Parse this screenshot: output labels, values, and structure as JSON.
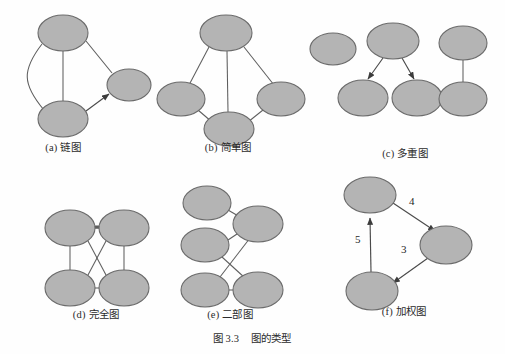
{
  "figure": {
    "number": "图 3.3",
    "title": "图的类型",
    "caption_full": "图 3.3    图的类型",
    "background_color": "#fefefe",
    "node_fill_color": "#b4b4b4",
    "node_stroke_color": "#6b6b6b",
    "edge_color": "#5e5e5e"
  },
  "panels": [
    {
      "id": "a",
      "label": "(a) 链图",
      "caption_x": 63,
      "caption_y": 143,
      "graph_type": "multigraph-with-directed-edge",
      "nodes": [
        {
          "id": "a1",
          "cx": 63,
          "cy": 33,
          "rx": 25,
          "ry": 18
        },
        {
          "id": "a2",
          "cx": 63,
          "cy": 119,
          "rx": 25,
          "ry": 18
        },
        {
          "id": "a3",
          "cx": 129,
          "cy": 85,
          "rx": 22,
          "ry": 16
        }
      ],
      "edges": [
        {
          "from": "a1",
          "to": "a2",
          "style": "straight"
        },
        {
          "from": "a1",
          "to": "a2",
          "style": "curved"
        },
        {
          "from": "a1",
          "to": "a3",
          "style": "straight"
        },
        {
          "from": "a2",
          "to": "a3",
          "style": "arrow"
        }
      ]
    },
    {
      "id": "b",
      "label": "(b) 简单图",
      "caption_x": 228,
      "caption_y": 143,
      "graph_type": "simple-graph",
      "nodes": [
        {
          "id": "b1",
          "cx": 226,
          "cy": 33,
          "rx": 26,
          "ry": 18
        },
        {
          "id": "b2",
          "cx": 181,
          "cy": 99,
          "rx": 24,
          "ry": 17
        },
        {
          "id": "b3",
          "cx": 281,
          "cy": 99,
          "rx": 24,
          "ry": 17
        },
        {
          "id": "b4",
          "cx": 229,
          "cy": 129,
          "rx": 25,
          "ry": 17
        }
      ],
      "edges": [
        {
          "from": "b1",
          "to": "b2",
          "style": "straight"
        },
        {
          "from": "b1",
          "to": "b3",
          "style": "straight"
        },
        {
          "from": "b1",
          "to": "b4",
          "style": "straight"
        },
        {
          "from": "b2",
          "to": "b4",
          "style": "straight"
        },
        {
          "from": "b3",
          "to": "b4",
          "style": "straight"
        }
      ]
    },
    {
      "id": "c",
      "label": "(c) 多重图",
      "caption_x": 405,
      "caption_y": 151,
      "graph_type": "multigraph",
      "nodes": [
        {
          "id": "c1",
          "cx": 333,
          "cy": 49,
          "rx": 23,
          "ry": 16
        },
        {
          "id": "c2",
          "cx": 393,
          "cy": 41,
          "rx": 26,
          "ry": 18
        },
        {
          "id": "c3",
          "cx": 363,
          "cy": 98,
          "rx": 25,
          "ry": 18
        },
        {
          "id": "c4",
          "cx": 417,
          "cy": 98,
          "rx": 25,
          "ry": 18
        },
        {
          "id": "c5",
          "cx": 463,
          "cy": 43,
          "rx": 24,
          "ry": 17
        },
        {
          "id": "c6",
          "cx": 463,
          "cy": 99,
          "rx": 24,
          "ry": 17
        }
      ],
      "edges": [
        {
          "from": "c2",
          "to": "c3",
          "style": "arrow"
        },
        {
          "from": "c2",
          "to": "c4",
          "style": "arrow"
        },
        {
          "from": "c5",
          "to": "c6",
          "style": "straight"
        }
      ]
    },
    {
      "id": "d",
      "label": "(d) 完全图",
      "caption_x": 96,
      "caption_y": 311,
      "graph_type": "complete-graph",
      "nodes": [
        {
          "id": "d1",
          "cx": 70,
          "cy": 228,
          "rx": 25,
          "ry": 18
        },
        {
          "id": "d2",
          "cx": 124,
          "cy": 228,
          "rx": 25,
          "ry": 18
        },
        {
          "id": "d3",
          "cx": 70,
          "cy": 288,
          "rx": 25,
          "ry": 18
        },
        {
          "id": "d4",
          "cx": 124,
          "cy": 288,
          "rx": 25,
          "ry": 18
        }
      ],
      "edges": [
        {
          "from": "d1",
          "to": "d2",
          "style": "straight"
        },
        {
          "from": "d1",
          "to": "d3",
          "style": "straight"
        },
        {
          "from": "d2",
          "to": "d4",
          "style": "straight"
        },
        {
          "from": "d3",
          "to": "d4",
          "style": "straight"
        },
        {
          "from": "d1",
          "to": "d4",
          "style": "straight"
        },
        {
          "from": "d2",
          "to": "d3",
          "style": "straight"
        }
      ]
    },
    {
      "id": "e",
      "label": "(e) 二部图",
      "caption_x": 230,
      "caption_y": 311,
      "graph_type": "bipartite-graph",
      "nodes": [
        {
          "id": "e1",
          "cx": 207,
          "cy": 203,
          "rx": 24,
          "ry": 17
        },
        {
          "id": "e2",
          "cx": 205,
          "cy": 245,
          "rx": 24,
          "ry": 17
        },
        {
          "id": "e3",
          "cx": 205,
          "cy": 290,
          "rx": 24,
          "ry": 17
        },
        {
          "id": "e4",
          "cx": 258,
          "cy": 224,
          "rx": 25,
          "ry": 18
        },
        {
          "id": "e5",
          "cx": 258,
          "cy": 290,
          "rx": 25,
          "ry": 18
        }
      ],
      "edges": [
        {
          "from": "e1",
          "to": "e4",
          "style": "straight"
        },
        {
          "from": "e2",
          "to": "e4",
          "style": "straight"
        },
        {
          "from": "e2",
          "to": "e5",
          "style": "straight"
        },
        {
          "from": "e3",
          "to": "e4",
          "style": "straight"
        },
        {
          "from": "e3",
          "to": "e5",
          "style": "straight"
        }
      ]
    },
    {
      "id": "f",
      "label": "(f) 加权图",
      "caption_x": 404,
      "caption_y": 307,
      "graph_type": "weighted-directed-graph",
      "nodes": [
        {
          "id": "f1",
          "cx": 370,
          "cy": 195,
          "rx": 26,
          "ry": 18
        },
        {
          "id": "f2",
          "cx": 446,
          "cy": 245,
          "rx": 26,
          "ry": 19
        },
        {
          "id": "f3",
          "cx": 372,
          "cy": 291,
          "rx": 26,
          "ry": 19
        }
      ],
      "edges": [
        {
          "from": "f1",
          "to": "f2",
          "style": "arrow",
          "weight": "4"
        },
        {
          "from": "f2",
          "to": "f3",
          "style": "arrow",
          "weight": "3"
        },
        {
          "from": "f3",
          "to": "f1",
          "style": "arrow",
          "weight": "5"
        }
      ],
      "weights": [
        {
          "value": "4",
          "x": 412,
          "y": 202
        },
        {
          "value": "5",
          "x": 358,
          "y": 240
        },
        {
          "value": "3",
          "x": 404,
          "y": 250
        }
      ]
    }
  ]
}
